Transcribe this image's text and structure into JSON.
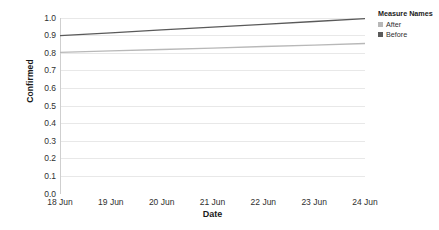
{
  "chart_data": {
    "type": "line",
    "title": "",
    "xlabel": "Date",
    "ylabel": "Confirmed",
    "categories": [
      "18 Jun",
      "19 Jun",
      "20 Jun",
      "21 Jun",
      "22 Jun",
      "23 Jun",
      "24 Jun"
    ],
    "x_tick_labels": [
      "18 Jun",
      "19 Jun",
      "20 Jun",
      "21 Jun",
      "22 Jun",
      "23 Jun",
      "24 Jun"
    ],
    "y_tick_labels": [
      "1.0",
      "0.9",
      "0.8",
      "0.7",
      "0.6",
      "0.5",
      "0.4",
      "0.3",
      "0.2",
      "0.1",
      "0.0"
    ],
    "y_tick_values": [
      1.0,
      0.9,
      0.8,
      0.7,
      0.6,
      0.5,
      0.4,
      0.3,
      0.2,
      0.1,
      0.0
    ],
    "ylim": [
      0.0,
      1.0
    ],
    "grid": true,
    "grid_axis": "y",
    "legend_position": "right",
    "legend_title": "Measure Names",
    "series": [
      {
        "name": "After",
        "color": "#b8b8b8",
        "values": [
          0.805,
          0.813,
          0.821,
          0.829,
          0.838,
          0.846,
          0.855
        ]
      },
      {
        "name": "Before",
        "color": "#5a5a5a",
        "values": [
          0.9,
          0.916,
          0.932,
          0.948,
          0.964,
          0.98,
          0.996
        ]
      }
    ]
  },
  "legend": {
    "title": "Measure Names",
    "items": [
      {
        "label": "After",
        "color": "#b8b8b8"
      },
      {
        "label": "Before",
        "color": "#5a5a5a"
      }
    ]
  },
  "axes": {
    "y_title": "Confirmed",
    "x_title": "Date"
  },
  "colors": {
    "grid": "#e8e8e8",
    "axis": "#cfcfcf",
    "text": "#2f2f2f",
    "title_text": "#1a1a1a",
    "background": "#ffffff"
  }
}
